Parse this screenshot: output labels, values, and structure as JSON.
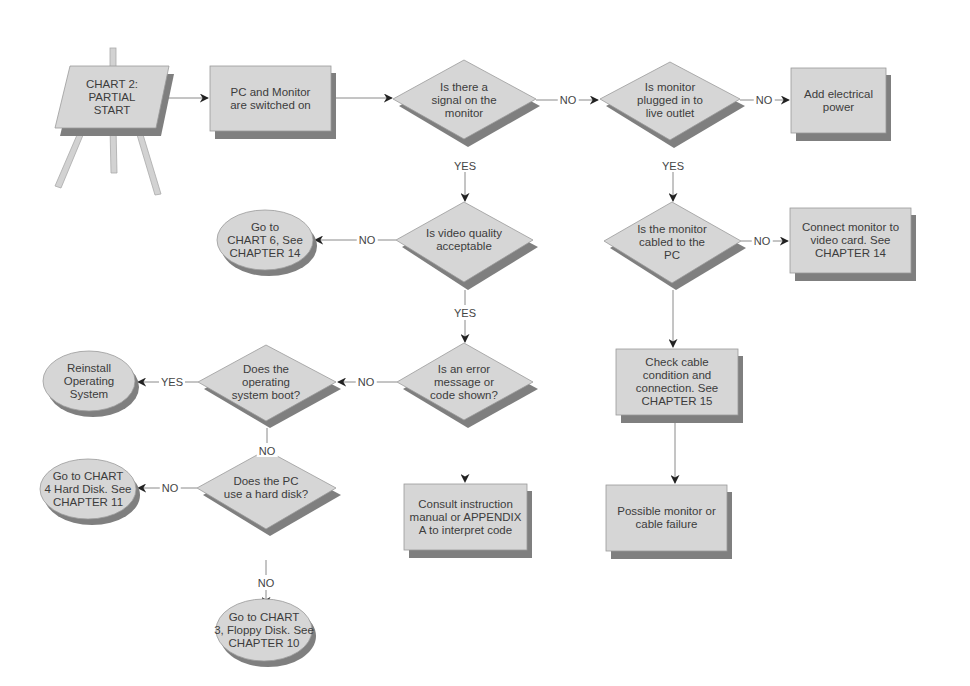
{
  "title": "CHART 2: PARTIAL START",
  "colors": {
    "node_fill": "#d6d6d6",
    "node_stroke": "#9a9a9a",
    "shadow": "#7f7f7f",
    "line": "#8a8a8a",
    "arrow": "#222222",
    "background": "#ffffff"
  },
  "nodes": {
    "start": {
      "shape": "easel",
      "text": "CHART 2:\nPARTIAL\nSTART"
    },
    "pc_on": {
      "shape": "box",
      "text": "PC and Monitor\nare switched on"
    },
    "signal": {
      "shape": "diamond",
      "text": "Is there a\nsignal on the\nmonitor"
    },
    "plugged": {
      "shape": "diamond",
      "text": "Is monitor\nplugged in to\nlive outlet"
    },
    "add_power": {
      "shape": "box",
      "text": "Add electrical\npower"
    },
    "video_quality": {
      "shape": "diamond",
      "text": "Is video quality\nacceptable"
    },
    "chart6": {
      "shape": "oval",
      "text": "Go to\nCHART 6, See\nCHAPTER 14"
    },
    "cabled": {
      "shape": "diamond",
      "text": "Is the monitor\ncabled to the\nPC"
    },
    "connect": {
      "shape": "box",
      "text": "Connect monitor to\nvideo card. See\nCHAPTER 14"
    },
    "error_code": {
      "shape": "diamond",
      "text": "Is an error\nmessage or\ncode shown?"
    },
    "os_boot": {
      "shape": "diamond",
      "text": "Does the\noperating\nsystem boot?"
    },
    "reinstall": {
      "shape": "oval",
      "text": "Reinstall\nOperating\nSystem"
    },
    "check_cable": {
      "shape": "box",
      "text": "Check cable\ncondition and\nconnection. See\nCHAPTER 15"
    },
    "hard_disk": {
      "shape": "diamond",
      "text": "Does the PC\nuse a hard disk?"
    },
    "chart4": {
      "shape": "oval",
      "text": "Go to CHART\n4 Hard Disk. See\nCHAPTER 11"
    },
    "consult": {
      "shape": "box",
      "text": "Consult instruction\nmanual or APPENDIX\nA to interpret code"
    },
    "monitor_failure": {
      "shape": "box",
      "text": "Possible monitor or\ncable failure"
    },
    "chart3": {
      "shape": "oval",
      "text": "Go to CHART\n3, Floppy Disk. See\nCHAPTER 10"
    }
  },
  "edges": [
    {
      "from": "start",
      "to": "pc_on",
      "label": ""
    },
    {
      "from": "pc_on",
      "to": "signal",
      "label": ""
    },
    {
      "from": "signal",
      "to": "plugged",
      "label": "NO"
    },
    {
      "from": "plugged",
      "to": "add_power",
      "label": "NO"
    },
    {
      "from": "signal",
      "to": "video_quality",
      "label": "YES"
    },
    {
      "from": "plugged",
      "to": "cabled",
      "label": "YES"
    },
    {
      "from": "video_quality",
      "to": "chart6",
      "label": "NO"
    },
    {
      "from": "cabled",
      "to": "connect",
      "label": "NO"
    },
    {
      "from": "video_quality",
      "to": "error_code",
      "label": "YES"
    },
    {
      "from": "cabled",
      "to": "check_cable",
      "label": ""
    },
    {
      "from": "error_code",
      "to": "os_boot",
      "label": "NO"
    },
    {
      "from": "os_boot",
      "to": "reinstall",
      "label": "YES"
    },
    {
      "from": "os_boot",
      "to": "hard_disk",
      "label": "NO"
    },
    {
      "from": "error_code",
      "to": "consult",
      "label": ""
    },
    {
      "from": "check_cable",
      "to": "monitor_failure",
      "label": ""
    },
    {
      "from": "hard_disk",
      "to": "chart4",
      "label": "NO"
    },
    {
      "from": "hard_disk",
      "to": "chart3",
      "label": "NO"
    }
  ],
  "labels": {
    "no": "NO",
    "yes": "YES"
  }
}
